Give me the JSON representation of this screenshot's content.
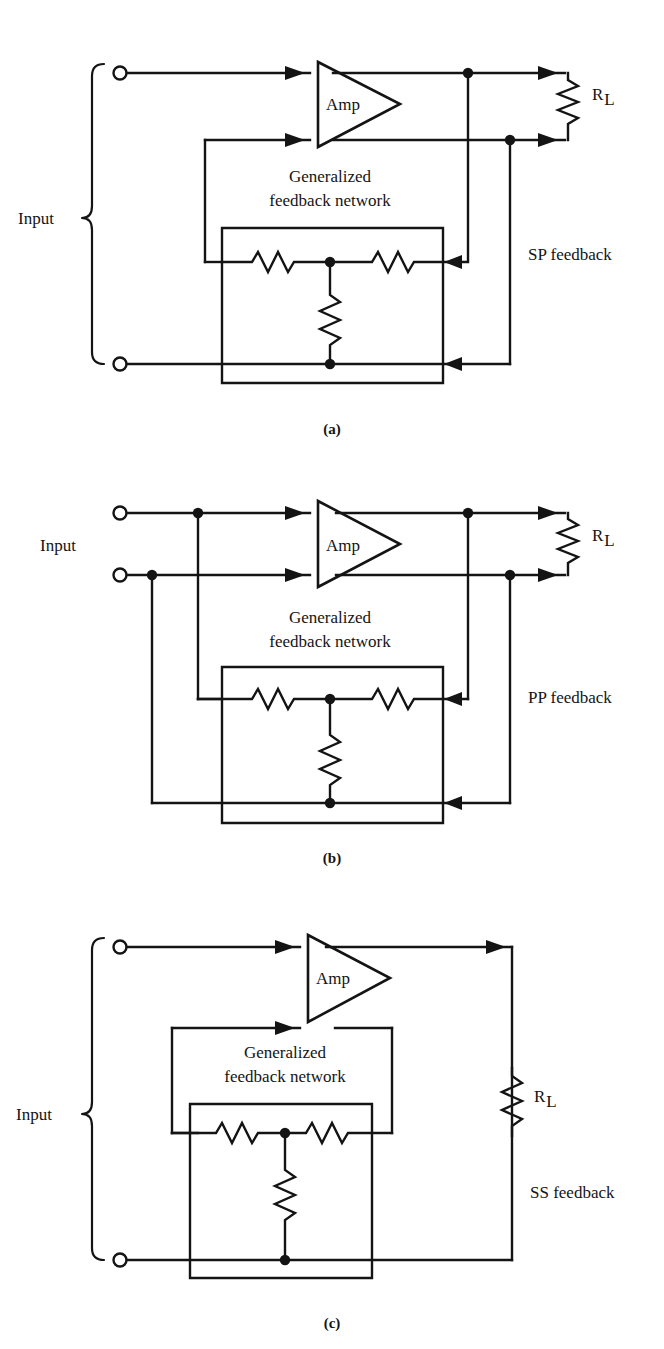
{
  "document": {
    "kind": "circuit-diagram-figure",
    "panel_count": 3,
    "line_color": "#141414",
    "background": "#ffffff"
  },
  "common_labels": {
    "input": "Input",
    "amp": "Amp",
    "network_line1": "Generalized",
    "network_line2": "feedback network",
    "load_symbol": "R",
    "load_subscript": "L"
  },
  "panels": [
    {
      "id": "a",
      "caption": "(a)",
      "input_label": "Input",
      "amp_label": "Amp",
      "network_line1": "Generalized",
      "network_line2": "feedback network",
      "load_symbol": "R",
      "load_subscript": "L",
      "feedback_label": "SP feedback",
      "topology": "series-parallel",
      "resistor_count": 3
    },
    {
      "id": "b",
      "caption": "(b)",
      "input_label": "Input",
      "amp_label": "Amp",
      "network_line1": "Generalized",
      "network_line2": "feedback network",
      "load_symbol": "R",
      "load_subscript": "L",
      "feedback_label": "PP feedback",
      "topology": "parallel-parallel",
      "resistor_count": 3
    },
    {
      "id": "c",
      "caption": "(c)",
      "input_label": "Input",
      "amp_label": "Amp",
      "network_line1": "Generalized",
      "network_line2": "feedback network",
      "load_symbol": "R",
      "load_subscript": "L",
      "feedback_label": "SS feedback",
      "topology": "series-series",
      "resistor_count": 3
    }
  ]
}
